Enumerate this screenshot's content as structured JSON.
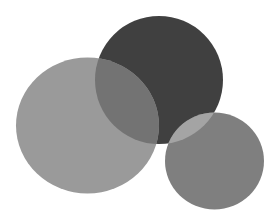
{
  "illustration": {
    "description": "Three overlapping grayscale circles",
    "background": "#ffffff",
    "shapes": [
      {
        "id": "dark-circle",
        "cx": 159,
        "cy": 80,
        "rx": 64,
        "ry": 64,
        "fill": "#404040"
      },
      {
        "id": "light-circle",
        "cx": 87.5,
        "cy": 125.5,
        "rx": 71.5,
        "ry": 68,
        "fill": "#9a9a9a"
      },
      {
        "id": "small-circle",
        "cx": 214.5,
        "cy": 161,
        "rx": 49.5,
        "ry": 48.5,
        "fill": "#7f7f7f"
      }
    ],
    "overlaps": {
      "light_over_dark": "#737373",
      "small_over_dark": "#a4a4a4"
    }
  }
}
